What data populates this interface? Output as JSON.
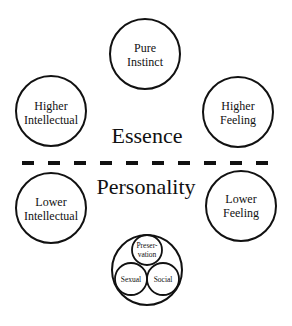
{
  "diagram": {
    "sections": {
      "top_label": "Essence",
      "bottom_label": "Personality"
    },
    "circles": {
      "pure_instinct": [
        "Pure",
        "Instinct"
      ],
      "higher_intellectual": [
        "Higher",
        "Intellectual"
      ],
      "higher_feeling": [
        "Higher",
        "Feeling"
      ],
      "lower_intellectual": [
        "Lower",
        "Intellectual"
      ],
      "lower_feeling": [
        "Lower",
        "Feeling"
      ]
    },
    "instincts": {
      "preservation": [
        "Preser-",
        "vation"
      ],
      "sexual": "Sexual",
      "social": "Social"
    },
    "divider": {
      "style": "dashed",
      "dash_count": 10
    }
  }
}
